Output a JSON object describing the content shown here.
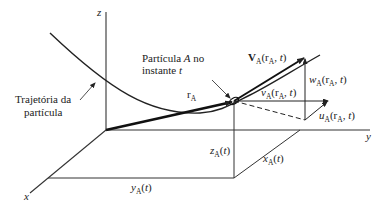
{
  "diagram": {
    "type": "3D coordinate diagram - particle velocity components",
    "axes": {
      "x": "x",
      "y": "y",
      "z": "z"
    },
    "labels": {
      "trajectory": [
        "Trajetória da",
        "partícula"
      ],
      "particle": [
        "Partícula A no",
        "instante t"
      ],
      "position_vector": "rA",
      "velocity": "VA(rA, t)",
      "w_component": "wA(rA, t)",
      "v_component": "vA(rA, t)",
      "u_component": "uA(rA, t)",
      "z_coord": "zA(t)",
      "x_coord": "xA(t)",
      "y_coord": "yA(t)"
    },
    "text": {
      "traj_line1": "Trajetória da",
      "traj_line2": "partícula",
      "part_line1a": "Partícula ",
      "part_line1b": "A",
      "part_line1c": " no",
      "part_line2a": "instante ",
      "part_line2b": "t",
      "ax_x": "x",
      "ax_y": "y",
      "ax_z": "z"
    }
  }
}
